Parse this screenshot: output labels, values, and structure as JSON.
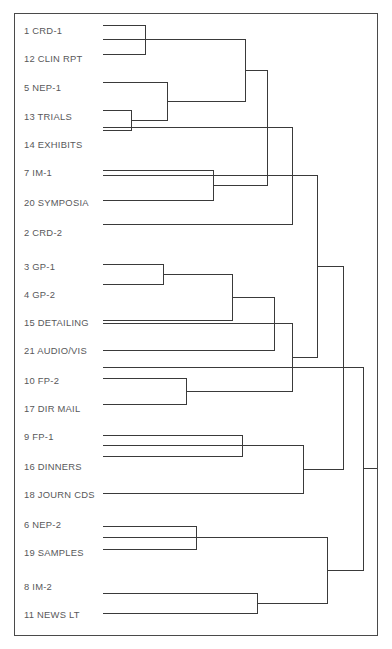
{
  "figure": {
    "title": "",
    "border_color": "#4a4a4a",
    "line_color": "#3a3a3a",
    "label_color": "#58585a",
    "background": "#ffffff"
  },
  "chart_data": {
    "type": "dendrogram",
    "title": "",
    "xlabel": "",
    "ylabel": "",
    "orientation": "horizontal-leaves-left",
    "grid": false,
    "legend": false,
    "leaf_labels": [
      "1 CRD-1",
      "12 CLIN RPT",
      "5 NEP-1",
      "13 TRIALS",
      "14 EXHIBITS",
      "7 IM-1",
      "20 SYMPOSIA",
      "2 CRD-2",
      "3 GP-1",
      "4 GP-2",
      "15 DETAILING",
      "21 AUDIO/VIS",
      "10 FP-2",
      "17 DIR MAIL",
      "9 FP-1",
      "16 DINNERS",
      "18 JOURN CDS",
      "6 NEP-2",
      "19 SAMPLES",
      "8 IM-2",
      "11 NEWS LT"
    ],
    "leaf_y": [
      25,
      54,
      82,
      110,
      130,
      170,
      200,
      224,
      264,
      284,
      320,
      350,
      378,
      404,
      435,
      456,
      493,
      526,
      549,
      593,
      613
    ],
    "label_y": [
      30,
      58,
      87,
      116,
      144,
      172,
      202,
      232,
      266,
      294,
      322,
      350,
      380,
      408,
      436,
      466,
      494,
      524,
      552,
      586,
      614
    ],
    "leaf_start_x": 103,
    "merges": [
      {
        "id": "m1",
        "label": "1 CRD-1 + 12 CLIN RPT",
        "x": 145,
        "y1": 25,
        "y2": 54
      },
      {
        "id": "m2",
        "label": "13 TRIALS + 14 EXHIBITS",
        "x": 131,
        "y1": 110,
        "y2": 130
      },
      {
        "id": "m3",
        "label": "5 NEP-1 + (13,14)",
        "x": 167,
        "y1": 82,
        "y2": 120
      },
      {
        "id": "m4",
        "label": "(1,12) + (5,13,14)",
        "x": 245,
        "y1": 39,
        "y2": 101
      },
      {
        "id": "m5",
        "label": "7 IM-1 + 20 SYMPOSIA",
        "x": 213,
        "y1": 170,
        "y2": 200
      },
      {
        "id": "m6",
        "label": "(1,12,5,13,14) + (7,20)",
        "x": 267,
        "y1": 70,
        "y2": 185
      },
      {
        "id": "m7",
        "label": "cluster-A + 2 CRD-2",
        "x": 292,
        "y1": 127,
        "y2": 224
      },
      {
        "id": "m8",
        "label": "3 GP-1 + 4 GP-2",
        "x": 163,
        "y1": 264,
        "y2": 284
      },
      {
        "id": "m9",
        "label": "(3,4) + 15 DETAILING",
        "x": 232,
        "y1": 274,
        "y2": 320
      },
      {
        "id": "m10",
        "label": "(3,4,15) + 21 AUDIO/VIS",
        "x": 274,
        "y1": 297,
        "y2": 350
      },
      {
        "id": "m11",
        "label": "10 FP-2 + 17 DIR MAIL",
        "x": 186,
        "y1": 378,
        "y2": 404
      },
      {
        "id": "m12",
        "label": "cluster-B + (10,17)",
        "x": 292,
        "y1": 323,
        "y2": 391
      },
      {
        "id": "m13",
        "label": "cluster-A2 + cluster-B2",
        "x": 317,
        "y1": 175,
        "y2": 357
      },
      {
        "id": "m14",
        "label": "9 FP-1 + 16 DINNERS",
        "x": 242,
        "y1": 435,
        "y2": 456
      },
      {
        "id": "m15",
        "label": "(9,16) + 18 JOURN CDS",
        "x": 303,
        "y1": 445,
        "y2": 493
      },
      {
        "id": "m16",
        "label": "cluster-C + (9,16,18)",
        "x": 343,
        "y1": 266,
        "y2": 469
      },
      {
        "id": "m17",
        "label": "6 NEP-2 + 19 SAMPLES",
        "x": 196,
        "y1": 526,
        "y2": 549
      },
      {
        "id": "m18",
        "label": "8 IM-2 + 11 NEWS LT",
        "x": 257,
        "y1": 593,
        "y2": 613
      },
      {
        "id": "m19",
        "label": "(6,19) + (8,11)",
        "x": 327,
        "y1": 537,
        "y2": 603
      },
      {
        "id": "m20",
        "label": "root",
        "x": 363,
        "y1": 367,
        "y2": 570
      }
    ],
    "root_stub": {
      "x_from": 363,
      "x_to": 377,
      "y": 468
    },
    "n_leaves": 21,
    "n_merges": 20
  }
}
